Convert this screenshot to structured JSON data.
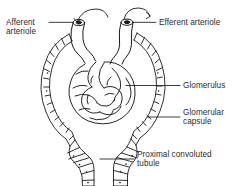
{
  "figure": {
    "type": "anatomical-line-diagram",
    "background_color": "#ffffff",
    "line_color": "#1a1a1a",
    "text_color": "#2b2b2b"
  },
  "labels": {
    "afferent_arteriole": "Afferent\narteriole",
    "efferent_arteriole": "Efferent arteriole",
    "glomerulus": "Glomerulus",
    "glomerular_capsule": "Glomerular\ncapsule",
    "proximal_convoluted_tubule": "Proximal convoluted\ntubule"
  },
  "structures": {
    "afferent_arteriole": "afferent-arteriole-vessel",
    "efferent_arteriole": "efferent-arteriole-vessel",
    "glomerulus": "glomerular-capillary-tuft",
    "glomerular_capsule": "bowmans-capsule-wall",
    "proximal_convoluted_tubule": "proximal-tubule",
    "flow_arrows": [
      "inflow-arrow",
      "outflow-arrow"
    ]
  }
}
